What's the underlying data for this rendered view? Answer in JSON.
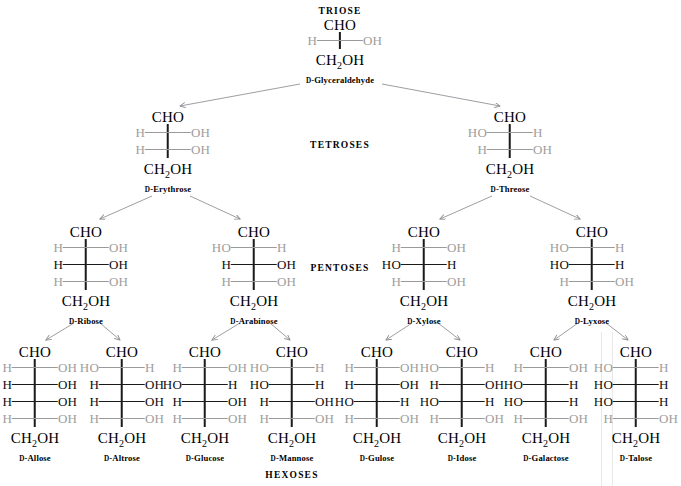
{
  "figure": {
    "levels": [
      {
        "id": "triose",
        "label": "TRIOSE",
        "label_x": 340,
        "label_y": 6
      },
      {
        "id": "tetrose",
        "label": "TETROSES",
        "label_x": 340,
        "label_y": 140
      },
      {
        "id": "pentose",
        "label": "PENTOSES",
        "label_x": 340,
        "label_y": 263
      },
      {
        "id": "hexose",
        "label": "HEXOSES",
        "label_x": 292,
        "label_y": 470
      }
    ],
    "colors": {
      "ink": "#111111",
      "dim": "#9d9d9d",
      "bond_dim": "#9a9a9a",
      "bond_lit": "#1a1a1a",
      "spine": "#1a1a1a",
      "arrow": "#8d8d94",
      "artifact": "#e8e8e8",
      "background": "#ffffff"
    },
    "top_label": "CHO",
    "bottom_label": "CH2OH",
    "bottom_label_html": "CH<sub>2</sub>OH",
    "d_prefix": "D",
    "artifacts": [
      {
        "name": "scan-line-left",
        "x": 601
      },
      {
        "name": "scan-line-right",
        "x": 612
      }
    ]
  },
  "sugars": [
    {
      "id": "glyceraldehyde",
      "name": "Glyceraldehyde",
      "label": "D-Glyceraldehyde",
      "level": "triose",
      "x": 340,
      "y": 18,
      "carbons": 3,
      "rungs": [
        {
          "left": "H",
          "right": "OH",
          "state": "dim"
        }
      ]
    },
    {
      "id": "erythrose",
      "name": "Erythrose",
      "label": "D-Erythrose",
      "level": "tetrose",
      "x": 168,
      "y": 110,
      "carbons": 4,
      "rungs": [
        {
          "left": "H",
          "right": "OH",
          "state": "dim"
        },
        {
          "left": "H",
          "right": "OH",
          "state": "dim"
        }
      ]
    },
    {
      "id": "threose",
      "name": "Threose",
      "label": "D-Threose",
      "level": "tetrose",
      "x": 510,
      "y": 110,
      "carbons": 4,
      "rungs": [
        {
          "left": "HO",
          "right": "H",
          "state": "dim"
        },
        {
          "left": "H",
          "right": "OH",
          "state": "dim"
        }
      ]
    },
    {
      "id": "ribose",
      "name": "Ribose",
      "label": "D-Ribose",
      "level": "pentose",
      "x": 86,
      "y": 225,
      "carbons": 5,
      "rungs": [
        {
          "left": "H",
          "right": "OH",
          "state": "dim"
        },
        {
          "left": "H",
          "right": "OH",
          "state": "lit"
        },
        {
          "left": "H",
          "right": "OH",
          "state": "dim"
        }
      ]
    },
    {
      "id": "arabinose",
      "name": "Arabinose",
      "label": "D-Arabinose",
      "level": "pentose",
      "x": 254,
      "y": 225,
      "carbons": 5,
      "rungs": [
        {
          "left": "HO",
          "right": "H",
          "state": "dim"
        },
        {
          "left": "H",
          "right": "OH",
          "state": "lit"
        },
        {
          "left": "H",
          "right": "OH",
          "state": "dim"
        }
      ]
    },
    {
      "id": "xylose",
      "name": "Xylose",
      "label": "D-Xylose",
      "level": "pentose",
      "x": 424,
      "y": 225,
      "carbons": 5,
      "rungs": [
        {
          "left": "H",
          "right": "OH",
          "state": "dim"
        },
        {
          "left": "HO",
          "right": "H",
          "state": "lit"
        },
        {
          "left": "H",
          "right": "OH",
          "state": "dim"
        }
      ]
    },
    {
      "id": "lyxose",
      "name": "Lyxose",
      "label": "D-Lyxose",
      "level": "pentose",
      "x": 592,
      "y": 225,
      "carbons": 5,
      "rungs": [
        {
          "left": "HO",
          "right": "H",
          "state": "dim"
        },
        {
          "left": "HO",
          "right": "H",
          "state": "lit"
        },
        {
          "left": "H",
          "right": "OH",
          "state": "dim"
        }
      ]
    },
    {
      "id": "allose",
      "name": "Allose",
      "label": "D-Allose",
      "level": "hexose",
      "x": 35,
      "y": 345,
      "carbons": 6,
      "rungs": [
        {
          "left": "H",
          "right": "OH",
          "state": "dim"
        },
        {
          "left": "H",
          "right": "OH",
          "state": "lit"
        },
        {
          "left": "H",
          "right": "OH",
          "state": "lit"
        },
        {
          "left": "H",
          "right": "OH",
          "state": "dim"
        }
      ]
    },
    {
      "id": "altrose",
      "name": "Altrose",
      "label": "D-Altrose",
      "level": "hexose",
      "x": 122,
      "y": 345,
      "carbons": 6,
      "rungs": [
        {
          "left": "HO",
          "right": "H",
          "state": "dim"
        },
        {
          "left": "H",
          "right": "OH",
          "state": "lit"
        },
        {
          "left": "H",
          "right": "OH",
          "state": "lit"
        },
        {
          "left": "H",
          "right": "OH",
          "state": "dim"
        }
      ]
    },
    {
      "id": "glucose",
      "name": "Glucose",
      "label": "D-Glucose",
      "level": "hexose",
      "x": 205,
      "y": 345,
      "carbons": 6,
      "rungs": [
        {
          "left": "H",
          "right": "OH",
          "state": "dim"
        },
        {
          "left": "HO",
          "right": "H",
          "state": "lit"
        },
        {
          "left": "H",
          "right": "OH",
          "state": "lit"
        },
        {
          "left": "H",
          "right": "OH",
          "state": "dim"
        }
      ]
    },
    {
      "id": "mannose",
      "name": "Mannose",
      "label": "D-Mannose",
      "level": "hexose",
      "x": 292,
      "y": 345,
      "carbons": 6,
      "rungs": [
        {
          "left": "HO",
          "right": "H",
          "state": "dim"
        },
        {
          "left": "HO",
          "right": "H",
          "state": "lit"
        },
        {
          "left": "H",
          "right": "OH",
          "state": "lit"
        },
        {
          "left": "H",
          "right": "OH",
          "state": "dim"
        }
      ]
    },
    {
      "id": "gulose",
      "name": "Gulose",
      "label": "D-Gulose",
      "level": "hexose",
      "x": 377,
      "y": 345,
      "carbons": 6,
      "rungs": [
        {
          "left": "H",
          "right": "OH",
          "state": "dim"
        },
        {
          "left": "H",
          "right": "OH",
          "state": "lit"
        },
        {
          "left": "HO",
          "right": "H",
          "state": "lit"
        },
        {
          "left": "H",
          "right": "OH",
          "state": "dim"
        }
      ]
    },
    {
      "id": "idose",
      "name": "Idose",
      "label": "D-Idose",
      "level": "hexose",
      "x": 462,
      "y": 345,
      "carbons": 6,
      "rungs": [
        {
          "left": "HO",
          "right": "H",
          "state": "dim"
        },
        {
          "left": "H",
          "right": "OH",
          "state": "lit"
        },
        {
          "left": "HO",
          "right": "H",
          "state": "lit"
        },
        {
          "left": "H",
          "right": "OH",
          "state": "dim"
        }
      ]
    },
    {
      "id": "galactose",
      "name": "Galactose",
      "label": "D-Galactose",
      "level": "hexose",
      "x": 546,
      "y": 345,
      "carbons": 6,
      "rungs": [
        {
          "left": "H",
          "right": "OH",
          "state": "dim"
        },
        {
          "left": "HO",
          "right": "H",
          "state": "lit"
        },
        {
          "left": "HO",
          "right": "H",
          "state": "lit"
        },
        {
          "left": "H",
          "right": "OH",
          "state": "dim"
        }
      ]
    },
    {
      "id": "talose",
      "name": "Talose",
      "label": "D-Talose",
      "level": "hexose",
      "x": 636,
      "y": 345,
      "carbons": 6,
      "rungs": [
        {
          "left": "HO",
          "right": "H",
          "state": "dim"
        },
        {
          "left": "HO",
          "right": "H",
          "state": "lit"
        },
        {
          "left": "HO",
          "right": "H",
          "state": "lit"
        },
        {
          "left": "H",
          "right": "OH",
          "state": "dim"
        }
      ]
    }
  ],
  "connectors": [
    {
      "from": "glyceraldehyde",
      "to": "erythrose",
      "x1": 300,
      "y1": 84,
      "x2": 180,
      "y2": 106
    },
    {
      "from": "glyceraldehyde",
      "to": "threose",
      "x1": 382,
      "y1": 84,
      "x2": 500,
      "y2": 106
    },
    {
      "from": "erythrose",
      "to": "ribose",
      "x1": 152,
      "y1": 196,
      "x2": 100,
      "y2": 219
    },
    {
      "from": "erythrose",
      "to": "arabinose",
      "x1": 190,
      "y1": 196,
      "x2": 240,
      "y2": 219
    },
    {
      "from": "threose",
      "to": "xylose",
      "x1": 492,
      "y1": 196,
      "x2": 440,
      "y2": 219
    },
    {
      "from": "threose",
      "to": "lyxose",
      "x1": 530,
      "y1": 196,
      "x2": 580,
      "y2": 219
    },
    {
      "from": "ribose",
      "to": "allose",
      "x1": 74,
      "y1": 323,
      "x2": 46,
      "y2": 340
    },
    {
      "from": "ribose",
      "to": "altrose",
      "x1": 100,
      "y1": 323,
      "x2": 120,
      "y2": 340
    },
    {
      "from": "arabinose",
      "to": "glucose",
      "x1": 240,
      "y1": 323,
      "x2": 212,
      "y2": 340
    },
    {
      "from": "arabinose",
      "to": "mannose",
      "x1": 270,
      "y1": 323,
      "x2": 290,
      "y2": 340
    },
    {
      "from": "xylose",
      "to": "gulose",
      "x1": 412,
      "y1": 323,
      "x2": 386,
      "y2": 340
    },
    {
      "from": "xylose",
      "to": "idose",
      "x1": 438,
      "y1": 323,
      "x2": 460,
      "y2": 340
    },
    {
      "from": "lyxose",
      "to": "galactose",
      "x1": 578,
      "y1": 323,
      "x2": 554,
      "y2": 340
    },
    {
      "from": "lyxose",
      "to": "talose",
      "x1": 606,
      "y1": 323,
      "x2": 628,
      "y2": 340
    }
  ]
}
